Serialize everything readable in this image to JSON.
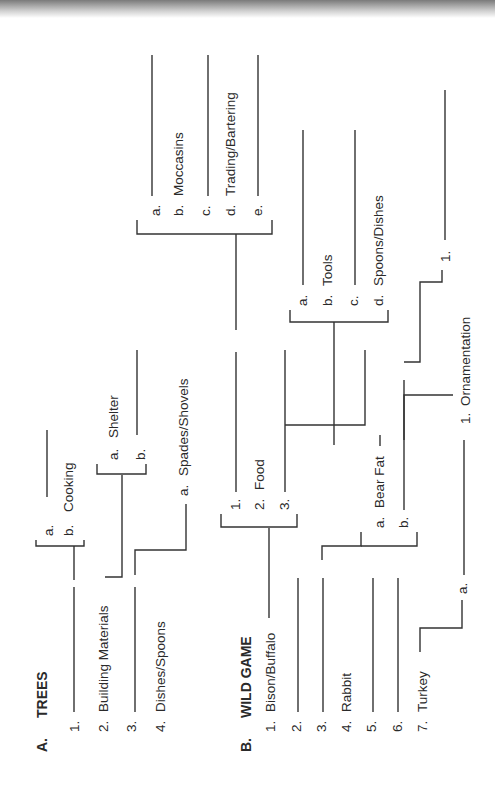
{
  "sectionA": {
    "letter": "A.",
    "title": "TREES",
    "items": [
      {
        "num": "1.",
        "label": ""
      },
      {
        "num": "2.",
        "label": "Building Materials"
      },
      {
        "num": "3.",
        "label": ""
      },
      {
        "num": "4.",
        "label": "Dishes/Spoons"
      }
    ],
    "item1_subs": [
      {
        "num": "a.",
        "label": ""
      },
      {
        "num": "b.",
        "label": "Cooking"
      }
    ],
    "item2_subs": [
      {
        "num": "a.",
        "label": "Shelter"
      },
      {
        "num": "b.",
        "label": ""
      }
    ],
    "item4_subs": [
      {
        "num": "a.",
        "label": "Spades/Shovels"
      }
    ]
  },
  "sectionB": {
    "letter": "B.",
    "title": "WILD GAME",
    "items": [
      {
        "num": "1.",
        "label": "Bison/Buffalo"
      },
      {
        "num": "2.",
        "label": ""
      },
      {
        "num": "3.",
        "label": ""
      },
      {
        "num": "4.",
        "label": "Rabbit"
      },
      {
        "num": "5.",
        "label": ""
      },
      {
        "num": "6.",
        "label": ""
      },
      {
        "num": "7.",
        "label": "Turkey"
      }
    ],
    "bison_uses": [
      {
        "num": "1.",
        "label": ""
      },
      {
        "num": "2.",
        "label": "Food"
      },
      {
        "num": "3.",
        "label": ""
      }
    ],
    "use1_subs": [
      {
        "num": "a.",
        "label": ""
      },
      {
        "num": "b.",
        "label": "Moccasins"
      },
      {
        "num": "c.",
        "label": ""
      },
      {
        "num": "d.",
        "label": "Trading/Bartering"
      },
      {
        "num": "e.",
        "label": ""
      }
    ],
    "use3_subs": [
      {
        "num": "a.",
        "label": ""
      },
      {
        "num": "b.",
        "label": "Tools"
      },
      {
        "num": "c.",
        "label": ""
      },
      {
        "num": "d.",
        "label": "Spoons/Dishes"
      }
    ],
    "item3_subs": [
      {
        "num": "a.",
        "label": "Bear Fat"
      },
      {
        "num": "b.",
        "label": ""
      }
    ],
    "bearfat_subs": [
      {
        "num": "1.",
        "label": "Ornamentation"
      }
    ],
    "b_sub_subs": [
      {
        "num": "1.",
        "label": ""
      }
    ],
    "turkey_subs": [
      {
        "num": "a.",
        "label": ""
      }
    ]
  }
}
